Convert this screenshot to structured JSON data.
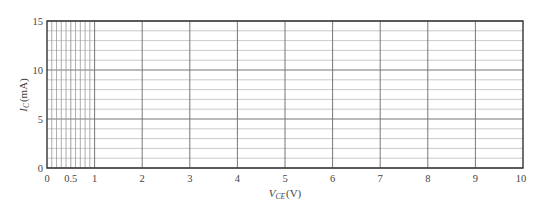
{
  "chart_data": {
    "type": "line",
    "title": "",
    "xlabel": "V_CE (V)",
    "xlabel_main": "V",
    "xlabel_sub": "CE",
    "xlabel_unit": "(V)",
    "ylabel": "I_C (mA)",
    "ylabel_main": "I",
    "ylabel_sub": "C",
    "ylabel_unit": "(mA)",
    "xlim": [
      0,
      10
    ],
    "ylim": [
      0,
      15
    ],
    "x_ticks": [
      0,
      0.5,
      1,
      2,
      3,
      4,
      5,
      6,
      7,
      8,
      9,
      10
    ],
    "x_tick_labels": [
      "0",
      "0.5",
      "1",
      "2",
      "3",
      "4",
      "5",
      "6",
      "7",
      "8",
      "9",
      "10"
    ],
    "y_ticks": [
      0,
      5,
      10,
      15
    ],
    "y_tick_labels": [
      "0",
      "5",
      "10",
      "15"
    ],
    "grid": true,
    "x_minor_grid_step_0_to_1": 0.1,
    "x_major_grid_step": 1,
    "y_minor_grid_step": 1,
    "y_major_grid_step": 5,
    "series": [],
    "legend": null
  }
}
